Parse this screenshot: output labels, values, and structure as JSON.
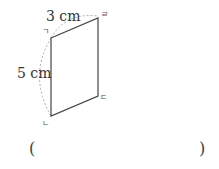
{
  "figure": {
    "shape": "parallelogram",
    "vertices": [
      {
        "label": "ㄱ"
      },
      {
        "label": "ㄴ"
      },
      {
        "label": "ㄷ"
      },
      {
        "label": "ㄹ"
      }
    ],
    "measurements": [
      {
        "side": "ㄱㄹ",
        "label": "3 cm"
      },
      {
        "side": "ㄱㄴ",
        "label": "5 cm"
      }
    ],
    "colors": {
      "edge": "#444444",
      "arc": "#aaaaaa"
    }
  },
  "answer": {
    "open_paren": "(",
    "close_paren": ")"
  }
}
